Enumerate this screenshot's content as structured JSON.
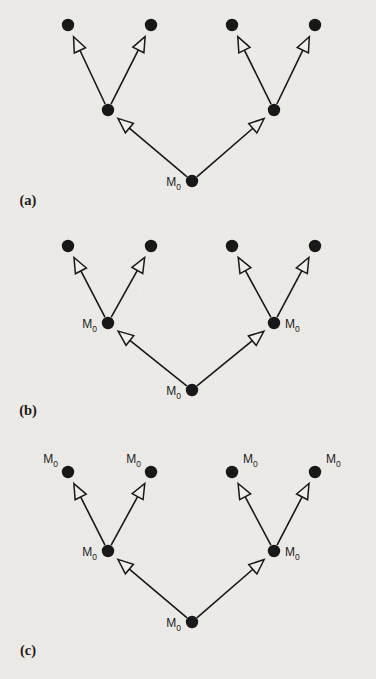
{
  "figure": {
    "background_color": "#eeece8",
    "ink_color": "#111111",
    "arrowhead_fill": "#f2f0ec",
    "label_text": "M",
    "label_subscript": "0",
    "panels": [
      {
        "id": "a",
        "caption": "(a)",
        "caption_pos": {
          "x": 28,
          "y": 205
        },
        "root": {
          "x": 192,
          "y": 181,
          "label": true,
          "label_side": "left"
        },
        "mids": [
          {
            "x": 108,
            "y": 110,
            "label": false,
            "label_side": "left"
          },
          {
            "x": 274,
            "y": 110,
            "label": false,
            "label_side": "right"
          }
        ],
        "leaves": [
          {
            "x": 68,
            "y": 25,
            "label": false,
            "label_side": "left"
          },
          {
            "x": 151,
            "y": 25,
            "label": false,
            "label_side": "right"
          },
          {
            "x": 232,
            "y": 25,
            "label": false,
            "label_side": "left"
          },
          {
            "x": 315,
            "y": 25,
            "label": false,
            "label_side": "right"
          }
        ]
      },
      {
        "id": "b",
        "caption": "(b)",
        "caption_pos": {
          "x": 28,
          "y": 415
        },
        "root": {
          "x": 192,
          "y": 390,
          "label": true,
          "label_side": "left"
        },
        "mids": [
          {
            "x": 108,
            "y": 323,
            "label": true,
            "label_side": "left"
          },
          {
            "x": 274,
            "y": 323,
            "label": true,
            "label_side": "right"
          }
        ],
        "leaves": [
          {
            "x": 68,
            "y": 246,
            "label": false,
            "label_side": "left"
          },
          {
            "x": 151,
            "y": 246,
            "label": false,
            "label_side": "right"
          },
          {
            "x": 232,
            "y": 246,
            "label": false,
            "label_side": "left"
          },
          {
            "x": 315,
            "y": 246,
            "label": false,
            "label_side": "right"
          }
        ]
      },
      {
        "id": "c",
        "caption": "(c)",
        "caption_pos": {
          "x": 28,
          "y": 655
        },
        "root": {
          "x": 192,
          "y": 622,
          "label": true,
          "label_side": "left"
        },
        "mids": [
          {
            "x": 108,
            "y": 551,
            "label": true,
            "label_side": "left"
          },
          {
            "x": 274,
            "y": 551,
            "label": true,
            "label_side": "right"
          }
        ],
        "leaves": [
          {
            "x": 68,
            "y": 472,
            "label": true,
            "label_side": "topleft"
          },
          {
            "x": 151,
            "y": 472,
            "label": true,
            "label_side": "topleft"
          },
          {
            "x": 232,
            "y": 472,
            "label": true,
            "label_side": "topright"
          },
          {
            "x": 315,
            "y": 472,
            "label": true,
            "label_side": "topright"
          }
        ]
      }
    ]
  }
}
